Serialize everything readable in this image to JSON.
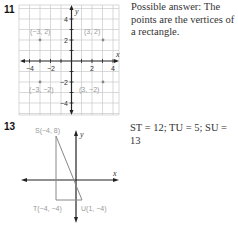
{
  "problems": [
    {
      "number": "11",
      "answer": "Possible answer: The points are the vertices of a rectangle.",
      "graph": {
        "x_label": "x",
        "y_label": "y",
        "x_ticks": [
          "−4",
          "−2",
          "2",
          "4"
        ],
        "y_ticks": [
          "4",
          "2",
          "−2",
          "−4"
        ],
        "points": [
          {
            "label": "(−3, 2)",
            "x": -3,
            "y": 2
          },
          {
            "label": "(3, 2)",
            "x": 3,
            "y": 2
          },
          {
            "label": "(−3, −2)",
            "x": -3,
            "y": -2
          },
          {
            "label": "(3, −2)",
            "x": 3,
            "y": -2
          }
        ]
      }
    },
    {
      "number": "13",
      "answer": "ST = 12; TU = 5; SU = 13",
      "graph": {
        "x_label": "x",
        "y_label": "y",
        "points": [
          {
            "label": "S(−4, 8)",
            "x": -4,
            "y": 8
          },
          {
            "label": "T(−4, −4)",
            "x": -4,
            "y": -4
          },
          {
            "label": "U(1, −4)",
            "x": 1,
            "y": -4
          }
        ]
      }
    }
  ]
}
